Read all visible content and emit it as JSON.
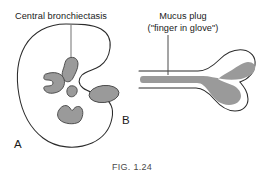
{
  "figure": {
    "caption": "FIG. 1.24",
    "background_color": "#ffffff",
    "outline_color": "#2b2b2b",
    "fill_gray": "#9a9a9a",
    "fill_gray_dark": "#8c8c8c",
    "leader_line_color": "#8d8d8d",
    "text_color": "#1a1a1a"
  },
  "panel_a": {
    "letter": "A",
    "label": "Central bronchiectasis",
    "description": "Axial lung cross-section outline with hilar notch containing five gray dilated central bronchi",
    "leader_line": {
      "from": {
        "x": 71,
        "y": 24
      },
      "to": {
        "x": 71,
        "y": 58
      }
    },
    "lesions": [
      {
        "name": "upper-bronchus-blob",
        "shape": "elongated-oval"
      },
      {
        "name": "left-c-shaped-blob",
        "shape": "crescent"
      },
      {
        "name": "central-small-blob",
        "shape": "small-oval"
      },
      {
        "name": "lower-notched-blob",
        "shape": "notched-arch"
      },
      {
        "name": "right-ellipse-blob",
        "shape": "ellipse"
      }
    ]
  },
  "panel_b": {
    "letter": "B",
    "label_line_1": "Mucus plug",
    "label_line_2": "(\"finger in glove\")",
    "description": "Y-shaped branching bronchus in longitudinal section filled with gray mucus forming the finger-in-glove sign",
    "leader_line": {
      "from": {
        "x": 168,
        "y": 34
      },
      "to": {
        "x": 168,
        "y": 72
      }
    }
  }
}
